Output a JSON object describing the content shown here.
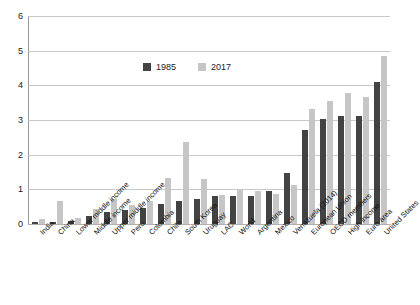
{
  "chart_data": {
    "type": "bar",
    "title": "",
    "subtitle": "",
    "xlabel": "",
    "ylabel": "",
    "ylim": [
      0,
      6
    ],
    "y_ticks": [
      0,
      1,
      2,
      3,
      4,
      5,
      6
    ],
    "grid": true,
    "legend_position": "top-center",
    "categories": [
      "India",
      "China",
      "Lower middle income",
      "Middle income",
      "Upper middle income",
      "Peru",
      "Colombia",
      "Chile",
      "South Korea",
      "Uruguay",
      "LAC",
      "World",
      "Argentina",
      "Mexico",
      "Venezuela (2014)",
      "European Union",
      "OECD members",
      "High income",
      "Euro area",
      "United States"
    ],
    "series": [
      {
        "name": "1985",
        "color": "#434343",
        "values": [
          0.05,
          0.05,
          0.08,
          0.22,
          0.35,
          0.4,
          0.46,
          0.58,
          0.67,
          0.73,
          0.8,
          0.82,
          0.82,
          0.95,
          1.48,
          2.7,
          3.02,
          3.12,
          3.13,
          4.09
        ]
      },
      {
        "name": "2017",
        "color": "#c6c6c6",
        "values": [
          0.15,
          0.66,
          0.16,
          0.42,
          0.73,
          0.54,
          0.66,
          1.34,
          2.37,
          1.29,
          0.83,
          0.97,
          0.95,
          0.88,
          1.12,
          3.32,
          3.55,
          3.79,
          3.65,
          4.84
        ]
      }
    ]
  },
  "legend": {
    "entries": [
      {
        "label": "1985"
      },
      {
        "label": "2017"
      }
    ]
  },
  "axis": {
    "y_tick_labels": [
      "0",
      "1",
      "2",
      "3",
      "4",
      "5",
      "6"
    ]
  }
}
